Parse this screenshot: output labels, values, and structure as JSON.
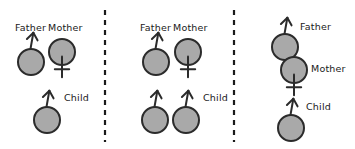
{
  "figure": {
    "type": "diagram",
    "title": "",
    "background": "#ffffff",
    "width": 355,
    "height": 149,
    "symbol_fill": "#a9a9a9",
    "symbol_stroke": "#2b2b2b",
    "label_color": "#1a1a1a",
    "divider_color": "#1a1a1a",
    "labels": {
      "father": "Father",
      "mother": "Mother",
      "child": "Child"
    },
    "icon_names": {
      "male": "male-symbol-icon",
      "female": "female-symbol-icon"
    },
    "dividers": [
      {
        "name": "panel-divider-1",
        "x": 105
      },
      {
        "name": "panel-divider-2",
        "x": 234
      }
    ],
    "panels": [
      {
        "name": "panel-1",
        "id": "panel-left",
        "symbols": [
          {
            "name": "father-symbol",
            "role": "father",
            "sex": "male",
            "cx": 31,
            "cy": 62,
            "r": 13,
            "label": "Father",
            "label_x": 15,
            "label_y": 31,
            "label_anchor": "start"
          },
          {
            "name": "mother-symbol",
            "role": "mother",
            "sex": "female",
            "cx": 62,
            "cy": 52,
            "r": 13,
            "label": "Mother",
            "label_x": 48,
            "label_y": 31,
            "label_anchor": "start"
          },
          {
            "name": "child-symbol",
            "role": "child",
            "sex": "male",
            "cx": 47,
            "cy": 120,
            "r": 13,
            "label": "Child",
            "label_x": 64,
            "label_y": 101,
            "label_anchor": "start"
          }
        ]
      },
      {
        "name": "panel-2",
        "id": "panel-middle",
        "symbols": [
          {
            "name": "father-symbol",
            "role": "father",
            "sex": "male",
            "cx": 156,
            "cy": 62,
            "r": 13,
            "label": "Father",
            "label_x": 140,
            "label_y": 31,
            "label_anchor": "start"
          },
          {
            "name": "mother-symbol",
            "role": "mother",
            "sex": "female",
            "cx": 188,
            "cy": 52,
            "r": 13,
            "label": "Mother",
            "label_x": 173,
            "label_y": 31,
            "label_anchor": "start"
          },
          {
            "name": "child-symbol-1",
            "role": "child",
            "sex": "male",
            "cx": 155,
            "cy": 120,
            "r": 13,
            "label": "",
            "label_x": 0,
            "label_y": 0,
            "label_anchor": "start"
          },
          {
            "name": "child-symbol-2",
            "role": "child",
            "sex": "male",
            "cx": 186,
            "cy": 120,
            "r": 13,
            "label": "Child",
            "label_x": 203,
            "label_y": 101,
            "label_anchor": "start"
          }
        ]
      },
      {
        "name": "panel-3",
        "id": "panel-right",
        "symbols": [
          {
            "name": "father-symbol",
            "role": "father",
            "sex": "male",
            "cx": 285,
            "cy": 47,
            "r": 13,
            "label": "Father",
            "label_x": 300,
            "label_y": 30,
            "label_anchor": "start"
          },
          {
            "name": "mother-symbol",
            "role": "mother",
            "sex": "female",
            "cx": 294,
            "cy": 70,
            "r": 13,
            "label": "Mother",
            "label_x": 311,
            "label_y": 72,
            "label_anchor": "start"
          },
          {
            "name": "child-symbol",
            "role": "child",
            "sex": "male",
            "cx": 291,
            "cy": 128,
            "r": 13,
            "label": "Child",
            "label_x": 306,
            "label_y": 110,
            "label_anchor": "start"
          }
        ]
      }
    ]
  }
}
